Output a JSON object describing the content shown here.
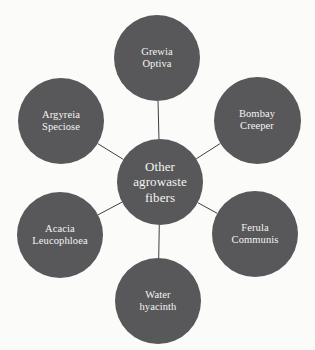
{
  "diagram": {
    "type": "radial-hub-and-spoke",
    "background_color": "#fbfbf9",
    "node_fill_color": "#58585a",
    "node_text_color": "#f4f4f2",
    "connector_color": "#3f3f41",
    "center": {
      "id": "other-agrowaste-fibers",
      "label": "Other\nagrowaste\nfibers",
      "cx": 160,
      "cy": 182,
      "d": 86
    },
    "satellites": [
      {
        "id": "grewia-optiva",
        "label": "Grewia\nOptiva",
        "cx": 157,
        "cy": 58,
        "d": 86
      },
      {
        "id": "bombay-creeper",
        "label": "Bombay\nCreeper",
        "cx": 257,
        "cy": 120,
        "d": 87
      },
      {
        "id": "ferula-communis",
        "label": "Ferula\nCommunis",
        "cx": 255,
        "cy": 234,
        "d": 86
      },
      {
        "id": "water-hyacinth",
        "label": "Water\nhyacinth",
        "cx": 158,
        "cy": 301,
        "d": 86
      },
      {
        "id": "acacia-leucophloea",
        "label": "Acacia\nLeucophloea",
        "cx": 60,
        "cy": 235,
        "d": 86
      },
      {
        "id": "argyreia-speciose",
        "label": "Argyreia\nSpeciose",
        "cx": 61,
        "cy": 121,
        "d": 86
      }
    ],
    "connectors": [
      {
        "from": "other-agrowaste-fibers",
        "to": "grewia-optiva"
      },
      {
        "from": "other-agrowaste-fibers",
        "to": "bombay-creeper"
      },
      {
        "from": "other-agrowaste-fibers",
        "to": "ferula-communis"
      },
      {
        "from": "other-agrowaste-fibers",
        "to": "water-hyacinth"
      },
      {
        "from": "other-agrowaste-fibers",
        "to": "acacia-leucophloea"
      },
      {
        "from": "other-agrowaste-fibers",
        "to": "argyreia-speciose"
      }
    ]
  }
}
